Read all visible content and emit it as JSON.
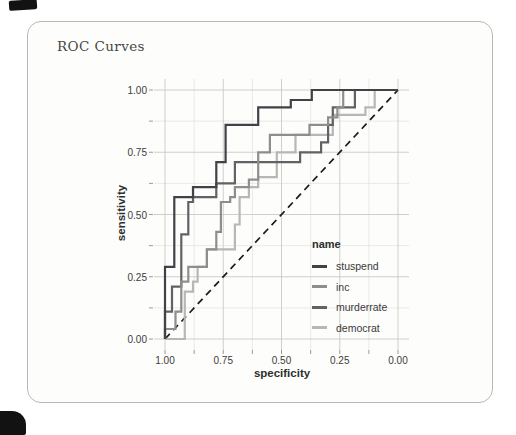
{
  "card": {
    "title": "ROC Curves"
  },
  "chart_data": {
    "type": "line",
    "subtype": "roc-step-curves",
    "title": "ROC Curves",
    "xlabel": "specificity",
    "ylabel": "sensitivity",
    "x_reversed": true,
    "xlim": [
      1.0,
      0.0
    ],
    "ylim": [
      0.0,
      1.0
    ],
    "x_major_ticks": [
      1.0,
      0.75,
      0.5,
      0.25,
      0.0
    ],
    "x_tick_labels": [
      "1.00",
      "0.75",
      "0.50",
      "0.25",
      "0.00"
    ],
    "y_major_ticks": [
      0.0,
      0.25,
      0.5,
      0.75,
      1.0
    ],
    "y_tick_labels": [
      "0.00",
      "0.25",
      "0.50",
      "0.75",
      "1.00"
    ],
    "minor_tick_values": [
      0.125,
      0.375,
      0.625,
      0.875
    ],
    "grid": "major and minor gridlines",
    "colors": {
      "grid_major": "#c9c9c5",
      "grid_minor": "#e4e4e0",
      "tick": "#9a9a96",
      "reference_line": "#1b1b1b"
    },
    "reference_line": {
      "style": "dashed",
      "from_spec_sens": [
        1.0,
        0.0
      ],
      "to_spec_sens": [
        0.0,
        1.0
      ]
    },
    "legend_title": "name",
    "legend_position": "inside right-middle",
    "series": [
      {
        "name": "stuspend",
        "color": "#414147",
        "points": [
          [
            1.0,
            0.0
          ],
          [
            1.0,
            0.29
          ],
          [
            0.96,
            0.29
          ],
          [
            0.96,
            0.57
          ],
          [
            0.88,
            0.57
          ],
          [
            0.88,
            0.61
          ],
          [
            0.78,
            0.61
          ],
          [
            0.78,
            0.71
          ],
          [
            0.74,
            0.71
          ],
          [
            0.74,
            0.86
          ],
          [
            0.6,
            0.86
          ],
          [
            0.6,
            0.93
          ],
          [
            0.46,
            0.93
          ],
          [
            0.46,
            0.96
          ],
          [
            0.37,
            0.96
          ],
          [
            0.37,
            1.0
          ],
          [
            0.0,
            1.0
          ]
        ]
      },
      {
        "name": "inc",
        "color": "#8e8e8e",
        "points": [
          [
            1.0,
            0.0
          ],
          [
            1.0,
            0.04
          ],
          [
            0.955,
            0.04
          ],
          [
            0.955,
            0.11
          ],
          [
            0.93,
            0.11
          ],
          [
            0.93,
            0.23
          ],
          [
            0.9,
            0.23
          ],
          [
            0.9,
            0.29
          ],
          [
            0.82,
            0.29
          ],
          [
            0.82,
            0.36
          ],
          [
            0.78,
            0.36
          ],
          [
            0.78,
            0.43
          ],
          [
            0.76,
            0.43
          ],
          [
            0.76,
            0.55
          ],
          [
            0.72,
            0.55
          ],
          [
            0.72,
            0.57
          ],
          [
            0.7,
            0.57
          ],
          [
            0.7,
            0.61
          ],
          [
            0.64,
            0.61
          ],
          [
            0.64,
            0.64
          ],
          [
            0.6,
            0.64
          ],
          [
            0.6,
            0.75
          ],
          [
            0.55,
            0.75
          ],
          [
            0.55,
            0.82
          ],
          [
            0.38,
            0.82
          ],
          [
            0.38,
            0.86
          ],
          [
            0.3,
            0.86
          ],
          [
            0.3,
            0.89
          ],
          [
            0.26,
            0.89
          ],
          [
            0.26,
            0.93
          ],
          [
            0.235,
            0.93
          ],
          [
            0.235,
            1.0
          ],
          [
            0.0,
            1.0
          ]
        ]
      },
      {
        "name": "murderrate",
        "color": "#626266",
        "points": [
          [
            1.0,
            0.0
          ],
          [
            1.0,
            0.11
          ],
          [
            0.97,
            0.11
          ],
          [
            0.97,
            0.21
          ],
          [
            0.93,
            0.21
          ],
          [
            0.93,
            0.42
          ],
          [
            0.9,
            0.42
          ],
          [
            0.9,
            0.55
          ],
          [
            0.88,
            0.55
          ],
          [
            0.88,
            0.57
          ],
          [
            0.78,
            0.57
          ],
          [
            0.78,
            0.625
          ],
          [
            0.7,
            0.625
          ],
          [
            0.7,
            0.71
          ],
          [
            0.42,
            0.71
          ],
          [
            0.42,
            0.75
          ],
          [
            0.33,
            0.75
          ],
          [
            0.33,
            0.79
          ],
          [
            0.3,
            0.79
          ],
          [
            0.3,
            0.86
          ],
          [
            0.28,
            0.86
          ],
          [
            0.28,
            0.93
          ],
          [
            0.185,
            0.93
          ],
          [
            0.185,
            1.0
          ],
          [
            0.0,
            1.0
          ]
        ]
      },
      {
        "name": "democrat",
        "color": "#b7b7b7",
        "points": [
          [
            1.0,
            0.0
          ],
          [
            0.915,
            0.0
          ],
          [
            0.915,
            0.19
          ],
          [
            0.88,
            0.19
          ],
          [
            0.88,
            0.23
          ],
          [
            0.86,
            0.23
          ],
          [
            0.86,
            0.29
          ],
          [
            0.82,
            0.29
          ],
          [
            0.82,
            0.36
          ],
          [
            0.7,
            0.36
          ],
          [
            0.7,
            0.46
          ],
          [
            0.68,
            0.46
          ],
          [
            0.68,
            0.57
          ],
          [
            0.64,
            0.57
          ],
          [
            0.64,
            0.61
          ],
          [
            0.6,
            0.61
          ],
          [
            0.6,
            0.65
          ],
          [
            0.52,
            0.65
          ],
          [
            0.52,
            0.75
          ],
          [
            0.44,
            0.75
          ],
          [
            0.44,
            0.82
          ],
          [
            0.28,
            0.82
          ],
          [
            0.28,
            0.9
          ],
          [
            0.14,
            0.9
          ],
          [
            0.14,
            0.93
          ],
          [
            0.1,
            0.93
          ],
          [
            0.1,
            1.0
          ],
          [
            0.0,
            1.0
          ]
        ]
      }
    ]
  }
}
